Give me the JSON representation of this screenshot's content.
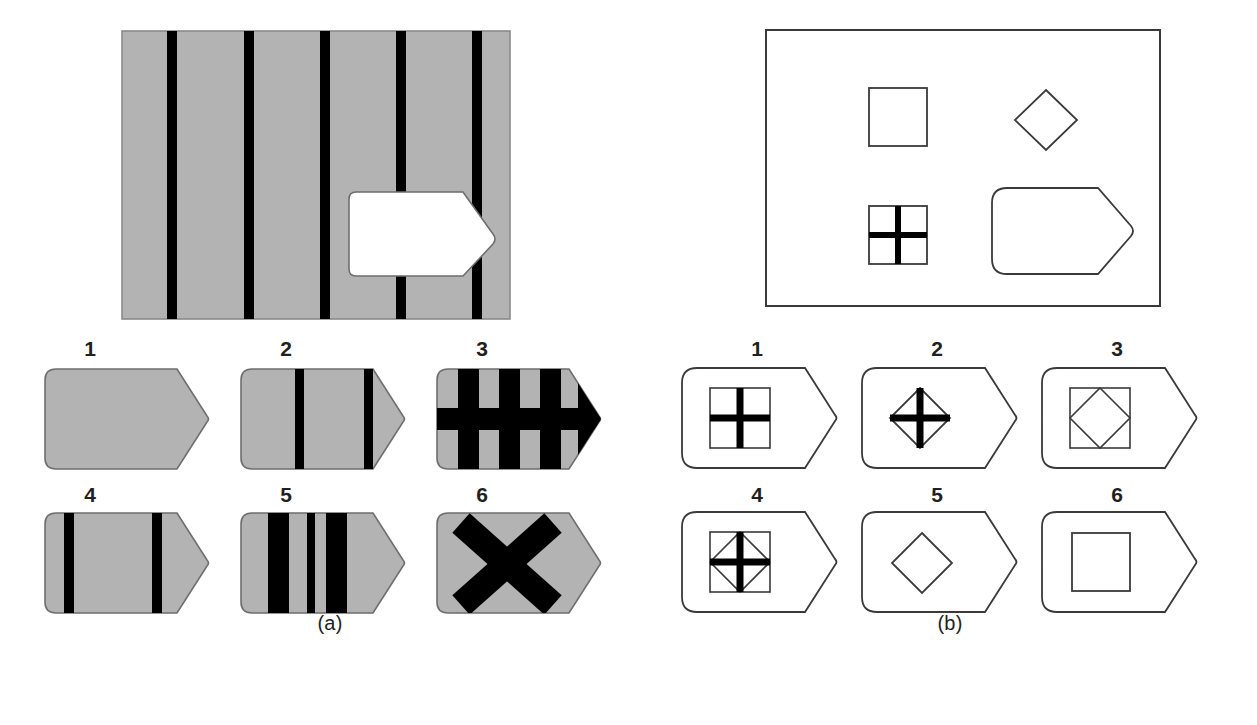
{
  "figure": {
    "type": "line-drawing-figure",
    "colors": {
      "background": "#ffffff",
      "grey_fill": "#b3b3b3",
      "stripe_black": "#000000",
      "outline": "#3a3a3a",
      "text": "#231f20"
    }
  },
  "panel_a": {
    "caption": "(a)",
    "stimulus": {
      "name": "striped-rectangle-with-tag-hole",
      "fill": "#b3b3b3",
      "stripe_color": "#000000",
      "stripe_count": 5,
      "hole_shape": "tag",
      "hole_fill": "#ffffff"
    },
    "options": [
      {
        "label": "1",
        "name": "plain-grey-tag",
        "pattern": "plain"
      },
      {
        "label": "2",
        "name": "grey-tag-two-thin-stripes",
        "pattern": "two-thin-stripes"
      },
      {
        "label": "3",
        "name": "grey-tag-grid-thick-stripes",
        "pattern": "thick-stripes-plus-horizontal-bar"
      },
      {
        "label": "4",
        "name": "grey-tag-two-stripes-wide",
        "pattern": "two-stripes-wide"
      },
      {
        "label": "5",
        "name": "grey-tag-three-thick-stripes",
        "pattern": "three-thick-stripes"
      },
      {
        "label": "6",
        "name": "grey-tag-big-x",
        "pattern": "x-cross"
      }
    ]
  },
  "panel_b": {
    "caption": "(b)",
    "stimulus": {
      "name": "outlined-rectangle-with-shapes",
      "contents": [
        {
          "name": "plain-square",
          "shape": "square"
        },
        {
          "name": "plain-diamond",
          "shape": "diamond"
        },
        {
          "name": "crossed-square",
          "shape": "square-with-bold-cross"
        },
        {
          "name": "large-tag-outline",
          "shape": "tag"
        }
      ]
    },
    "options": [
      {
        "label": "1",
        "name": "tag-with-crossed-square",
        "pattern": "square-with-bold-cross"
      },
      {
        "label": "2",
        "name": "tag-with-crossed-diamond",
        "pattern": "diamond-with-bold-cross"
      },
      {
        "label": "3",
        "name": "tag-with-square-and-diamond",
        "pattern": "square-plus-inscribed-diamond"
      },
      {
        "label": "4",
        "name": "tag-with-square-diamond-and-cross",
        "pattern": "square-plus-diamond-plus-bold-cross"
      },
      {
        "label": "5",
        "name": "tag-with-diamond",
        "pattern": "diamond"
      },
      {
        "label": "6",
        "name": "tag-with-square",
        "pattern": "square"
      }
    ]
  }
}
